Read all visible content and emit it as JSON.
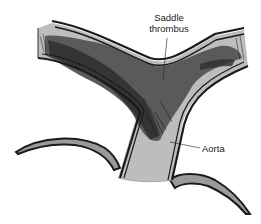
{
  "figure": {
    "labels": {
      "saddle_line1": "Saddle",
      "saddle_line2": "thrombus",
      "aorta": "Aorta"
    },
    "colors": {
      "vessel_wall": "#1a1a1a",
      "vessel_lumen": "#b8b8b8",
      "thrombus": "#5a5a5a",
      "thrombus_dark": "#2a2a2a",
      "background": "#ffffff"
    }
  }
}
